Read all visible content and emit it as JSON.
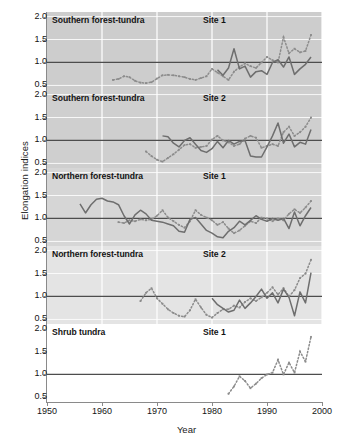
{
  "chart_data": {
    "type": "line",
    "title": "",
    "xlabel": "Year",
    "ylabel": "Elongation indices",
    "xlim": [
      1950,
      2000
    ],
    "xticks": [
      1950,
      1960,
      1970,
      1980,
      1990,
      2000
    ],
    "ylim": [
      0.4,
      2.1
    ],
    "yticks": [
      0.5,
      1.0,
      1.5,
      2.0
    ],
    "ytick_labels": [
      "0.5",
      "1.0",
      "1.5",
      "2.0"
    ],
    "grid": "vertical white gridlines at decade ticks; horizontal reference line at 1.0",
    "legend": "none",
    "reference_line": 1.0,
    "panels": [
      {
        "name": "Southern forest-tundra",
        "site": "Site 1",
        "background": "#cdcdcd",
        "series": [
          {
            "name": "dotted-index",
            "style": "dotted",
            "color": "#8c8c8c",
            "x": [
              1962,
              1963,
              1964,
              1965,
              1966,
              1967,
              1968,
              1969,
              1970,
              1971,
              1972,
              1973,
              1974,
              1975,
              1976,
              1977,
              1978,
              1979,
              1980,
              1981,
              1982,
              1983,
              1984,
              1985,
              1986,
              1987,
              1988,
              1989,
              1990,
              1991,
              1992,
              1993,
              1994,
              1995,
              1996,
              1997,
              1998
            ],
            "y": [
              0.62,
              0.64,
              0.7,
              0.68,
              0.6,
              0.56,
              0.55,
              0.57,
              0.65,
              0.72,
              0.73,
              0.72,
              0.7,
              0.68,
              0.64,
              0.62,
              0.66,
              0.7,
              0.86,
              0.78,
              0.7,
              0.62,
              0.8,
              0.9,
              0.98,
              0.92,
              0.88,
              1.0,
              1.12,
              1.05,
              1.0,
              1.55,
              1.2,
              1.3,
              1.22,
              1.25,
              1.6
            ]
          },
          {
            "name": "solid-index",
            "style": "solid",
            "color": "#6e6e6e",
            "x": [
              1981,
              1982,
              1983,
              1984,
              1985,
              1986,
              1987,
              1988,
              1989,
              1990,
              1991,
              1992,
              1993,
              1994,
              1995,
              1996,
              1997,
              1998
            ],
            "y": [
              0.84,
              0.72,
              0.88,
              1.3,
              0.86,
              0.92,
              0.68,
              0.8,
              0.82,
              0.74,
              1.0,
              1.06,
              0.9,
              1.12,
              0.74,
              0.86,
              0.96,
              1.12
            ]
          }
        ]
      },
      {
        "name": "Southern forest-tundra",
        "site": "Site 2",
        "background": "#cfcfcf",
        "series": [
          {
            "name": "dotted-index",
            "style": "dotted",
            "color": "#8c8c8c",
            "x": [
              1968,
              1969,
              1970,
              1971,
              1972,
              1973,
              1974,
              1975,
              1976,
              1977,
              1978,
              1979,
              1980,
              1981,
              1982,
              1983,
              1984,
              1985,
              1986,
              1987,
              1988,
              1989,
              1990,
              1991,
              1992,
              1993,
              1994,
              1995,
              1996,
              1997,
              1998
            ],
            "y": [
              0.76,
              0.66,
              0.58,
              0.54,
              0.62,
              0.7,
              0.8,
              0.9,
              0.92,
              0.84,
              0.86,
              0.88,
              1.02,
              1.1,
              1.0,
              0.96,
              0.88,
              0.92,
              1.04,
              1.1,
              1.06,
              0.84,
              0.88,
              0.92,
              0.88,
              1.18,
              1.3,
              1.1,
              1.18,
              1.3,
              1.5
            ]
          },
          {
            "name": "solid-index",
            "style": "solid",
            "color": "#6e6e6e",
            "x": [
              1971,
              1972,
              1973,
              1974,
              1975,
              1976,
              1977,
              1978,
              1979,
              1980,
              1981,
              1982,
              1983,
              1984,
              1985,
              1986,
              1987,
              1988,
              1989,
              1990,
              1991,
              1992,
              1993,
              1994,
              1995,
              1996,
              1997,
              1998
            ],
            "y": [
              1.1,
              1.08,
              0.94,
              0.86,
              1.0,
              1.06,
              0.92,
              0.78,
              0.74,
              0.82,
              0.98,
              0.84,
              1.0,
              0.92,
              0.98,
              1.0,
              0.66,
              0.64,
              0.64,
              0.86,
              1.1,
              1.38,
              0.94,
              1.14,
              0.86,
              0.96,
              0.92,
              1.24
            ]
          }
        ]
      },
      {
        "name": "Northern forest-tundra",
        "site": "Site 1",
        "background": "#d6d6d6",
        "series": [
          {
            "name": "dotted-index",
            "style": "dotted",
            "color": "#8c8c8c",
            "x": [
              1963,
              1964,
              1965,
              1966,
              1967,
              1968,
              1969,
              1970,
              1971,
              1972,
              1973,
              1974,
              1975,
              1976,
              1977,
              1978,
              1979,
              1980,
              1981,
              1982,
              1983,
              1984,
              1985,
              1986,
              1987,
              1988,
              1989,
              1990,
              1991,
              1992,
              1993,
              1994,
              1995,
              1996,
              1997,
              1998
            ],
            "y": [
              0.92,
              0.9,
              0.96,
              0.94,
              0.98,
              0.96,
              0.98,
              1.06,
              1.18,
              1.02,
              0.94,
              0.86,
              0.8,
              0.94,
              1.18,
              1.08,
              1.02,
              0.96,
              0.86,
              0.92,
              0.78,
              0.68,
              0.74,
              0.84,
              0.94,
              0.9,
              1.02,
              1.0,
              0.94,
              1.0,
              0.96,
              1.1,
              1.2,
              1.12,
              1.24,
              1.38
            ]
          },
          {
            "name": "solid-index",
            "style": "solid",
            "color": "#6e6e6e",
            "x": [
              1956,
              1957,
              1958,
              1959,
              1960,
              1961,
              1962,
              1963,
              1964,
              1965,
              1966,
              1967,
              1968,
              1969,
              1970,
              1971,
              1972,
              1973,
              1974,
              1975,
              1976,
              1977,
              1978,
              1979,
              1980,
              1981,
              1982,
              1983,
              1984,
              1985,
              1986,
              1987,
              1988,
              1989,
              1990,
              1991,
              1992,
              1993,
              1994,
              1995,
              1996,
              1997,
              1998
            ],
            "y": [
              1.32,
              1.12,
              1.3,
              1.42,
              1.44,
              1.38,
              1.36,
              1.3,
              1.06,
              0.88,
              1.08,
              1.18,
              1.1,
              0.96,
              0.94,
              0.92,
              0.88,
              0.84,
              0.72,
              0.7,
              0.98,
              1.02,
              0.88,
              0.74,
              0.68,
              0.6,
              0.58,
              0.72,
              0.8,
              0.94,
              0.86,
              0.96,
              1.06,
              0.98,
              0.94,
              1.0,
              0.96,
              1.0,
              0.78,
              1.14,
              0.84,
              1.06,
              1.24
            ]
          }
        ]
      },
      {
        "name": "Northern forest-tundra",
        "site": "Site 2",
        "background": "#e4e4e4",
        "series": [
          {
            "name": "dotted-index",
            "style": "dotted",
            "color": "#8c8c8c",
            "x": [
              1967,
              1968,
              1969,
              1970,
              1971,
              1972,
              1973,
              1974,
              1975,
              1976,
              1977,
              1978,
              1979,
              1980,
              1981,
              1982,
              1983,
              1984,
              1985,
              1986,
              1987,
              1988,
              1989,
              1990,
              1991,
              1992,
              1993,
              1994,
              1995,
              1996,
              1997,
              1998
            ],
            "y": [
              0.9,
              1.08,
              1.18,
              0.96,
              0.84,
              0.72,
              0.64,
              0.58,
              0.56,
              0.7,
              0.94,
              0.76,
              0.6,
              0.54,
              0.64,
              0.72,
              0.72,
              0.8,
              0.76,
              0.88,
              0.96,
              0.9,
              0.98,
              1.08,
              1.2,
              1.04,
              1.18,
              1.0,
              1.14,
              1.4,
              1.5,
              1.8
            ]
          },
          {
            "name": "solid-index",
            "style": "solid",
            "color": "#6e6e6e",
            "x": [
              1980,
              1981,
              1982,
              1983,
              1984,
              1985,
              1986,
              1987,
              1988,
              1989,
              1990,
              1991,
              1992,
              1993,
              1994,
              1995,
              1996,
              1997,
              1998
            ],
            "y": [
              0.96,
              0.82,
              0.74,
              0.66,
              0.7,
              0.92,
              0.74,
              0.86,
              1.0,
              1.16,
              0.96,
              1.08,
              0.86,
              1.16,
              0.98,
              0.58,
              1.1,
              0.86,
              1.52
            ]
          }
        ]
      },
      {
        "name": "Shrub tundra",
        "site": "Site 1",
        "background": "#ffffff",
        "series": [
          {
            "name": "dotted-index",
            "style": "dotted",
            "color": "#8c8c8c",
            "x": [
              1983,
              1984,
              1985,
              1986,
              1987,
              1988,
              1989,
              1990,
              1991,
              1992,
              1993,
              1994,
              1995,
              1996,
              1997,
              1998
            ],
            "y": [
              0.58,
              0.74,
              0.96,
              0.86,
              0.7,
              0.8,
              0.92,
              1.0,
              1.04,
              1.32,
              1.0,
              1.26,
              1.04,
              1.5,
              1.28,
              1.82
            ]
          }
        ]
      }
    ]
  }
}
